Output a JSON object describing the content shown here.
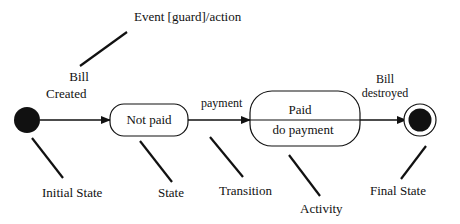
{
  "diagram": {
    "type": "UML state machine",
    "annotation_event": "Event [guard]/action",
    "transitions": [
      {
        "id": "t1",
        "from": "initial",
        "to": "not_paid",
        "label_line1": "Bill",
        "label_line2": "Created"
      },
      {
        "id": "t2",
        "from": "not_paid",
        "to": "paid",
        "label_line1": "payment"
      },
      {
        "id": "t3",
        "from": "paid",
        "to": "final",
        "label_line1": "Bill",
        "label_line2": "destroyed"
      }
    ],
    "states": {
      "not_paid": {
        "name": "Not paid"
      },
      "paid": {
        "name": "Paid",
        "activity": "do payment"
      }
    },
    "legend_labels": {
      "initial_state": "Initial State",
      "state": "State",
      "transition": "Transition",
      "activity": "Activity",
      "final_state": "Final State"
    },
    "colors": {
      "stroke": "#111111",
      "fill_dark": "#111111",
      "background": "#ffffff"
    }
  }
}
